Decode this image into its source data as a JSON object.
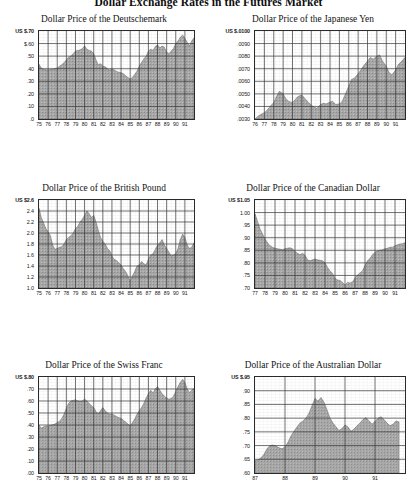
{
  "page": {
    "title": "Dollar Exchange Rates in the Futures Market",
    "background_color": "#ffffff",
    "fill_color": "#a8a8a8",
    "grid_color": "#333333",
    "axis_color": "#2a2a2a"
  },
  "chart_data": [
    {
      "id": "deutschemark",
      "type": "area",
      "title": "Dollar Price of the Deutschemark",
      "xlabel": "",
      "ylabel": "",
      "ylim": [
        0.0,
        0.7
      ],
      "ytick_labels": [
        "US $.70",
        "$.60",
        ".50",
        ".40",
        ".30",
        ".20",
        ".10",
        ".0"
      ],
      "ytick_values": [
        0.7,
        0.6,
        0.5,
        0.4,
        0.3,
        0.2,
        0.1,
        0.0
      ],
      "xtick_labels": [
        "75",
        "76",
        "77",
        "78",
        "79",
        "80",
        "81",
        "82",
        "83",
        "84",
        "85",
        "86",
        "87",
        "88",
        "89",
        "90",
        "91"
      ],
      "xlim": [
        1975,
        1992
      ],
      "grid": true,
      "x": [
        1975.0,
        1975.25,
        1975.5,
        1975.75,
        1976.0,
        1976.25,
        1976.5,
        1976.75,
        1977.0,
        1977.25,
        1977.5,
        1977.75,
        1978.0,
        1978.25,
        1978.5,
        1978.75,
        1979.0,
        1979.25,
        1979.5,
        1979.75,
        1980.0,
        1980.25,
        1980.5,
        1980.75,
        1981.0,
        1981.25,
        1981.5,
        1981.75,
        1982.0,
        1982.25,
        1982.5,
        1982.75,
        1983.0,
        1983.25,
        1983.5,
        1983.75,
        1984.0,
        1984.25,
        1984.5,
        1984.75,
        1985.0,
        1985.25,
        1985.5,
        1985.75,
        1986.0,
        1986.25,
        1986.5,
        1986.75,
        1987.0,
        1987.25,
        1987.5,
        1987.75,
        1988.0,
        1988.25,
        1988.5,
        1988.75,
        1989.0,
        1989.25,
        1989.5,
        1989.75,
        1990.0,
        1990.25,
        1990.5,
        1990.75,
        1991.0,
        1991.25,
        1991.5,
        1991.75,
        1992.0
      ],
      "values": [
        0.435,
        0.405,
        0.395,
        0.392,
        0.39,
        0.393,
        0.397,
        0.4,
        0.405,
        0.42,
        0.432,
        0.448,
        0.47,
        0.492,
        0.5,
        0.52,
        0.54,
        0.545,
        0.548,
        0.56,
        0.58,
        0.555,
        0.545,
        0.54,
        0.52,
        0.47,
        0.43,
        0.44,
        0.42,
        0.415,
        0.4,
        0.39,
        0.398,
        0.39,
        0.378,
        0.372,
        0.368,
        0.36,
        0.345,
        0.33,
        0.318,
        0.33,
        0.355,
        0.38,
        0.42,
        0.45,
        0.478,
        0.5,
        0.54,
        0.555,
        0.545,
        0.575,
        0.59,
        0.565,
        0.58,
        0.57,
        0.53,
        0.52,
        0.54,
        0.56,
        0.6,
        0.62,
        0.65,
        0.668,
        0.64,
        0.61,
        0.58,
        0.62,
        0.645
      ]
    },
    {
      "id": "japanese-yen",
      "type": "area",
      "title": "Dollar Price of the Japanese Yen",
      "xlabel": "",
      "ylabel": "",
      "ylim": [
        0.003,
        0.01
      ],
      "ytick_labels": [
        "US $.0100",
        ".0090",
        ".0080",
        ".0070",
        ".0060",
        ".0050",
        ".0040",
        ".0030"
      ],
      "ytick_values": [
        0.01,
        0.009,
        0.008,
        0.007,
        0.006,
        0.005,
        0.004,
        0.003
      ],
      "xtick_labels": [
        "76",
        "77",
        "78",
        "79",
        "80",
        "81",
        "82",
        "83",
        "84",
        "85",
        "86",
        "87",
        "88",
        "89",
        "90",
        "91"
      ],
      "xlim": [
        1976,
        1992
      ],
      "grid": true,
      "x": [
        1976.0,
        1976.3,
        1976.6,
        1977.0,
        1977.3,
        1977.6,
        1978.0,
        1978.3,
        1978.6,
        1979.0,
        1979.3,
        1979.6,
        1980.0,
        1980.3,
        1980.6,
        1981.0,
        1981.3,
        1981.6,
        1982.0,
        1982.3,
        1982.6,
        1983.0,
        1983.3,
        1983.6,
        1984.0,
        1984.3,
        1984.6,
        1985.0,
        1985.3,
        1985.6,
        1986.0,
        1986.3,
        1986.6,
        1987.0,
        1987.3,
        1987.6,
        1988.0,
        1988.3,
        1988.6,
        1989.0,
        1989.3,
        1989.6,
        1990.0,
        1990.3,
        1990.6,
        1991.0,
        1991.3,
        1991.6,
        1992.0
      ],
      "values": [
        0.003,
        0.0032,
        0.00335,
        0.0035,
        0.0037,
        0.004,
        0.0043,
        0.0048,
        0.0052,
        0.005,
        0.0046,
        0.0044,
        0.0043,
        0.00455,
        0.0048,
        0.0049,
        0.00465,
        0.0044,
        0.0041,
        0.00395,
        0.00385,
        0.00415,
        0.00425,
        0.0042,
        0.00435,
        0.0044,
        0.00415,
        0.0042,
        0.0044,
        0.0049,
        0.0056,
        0.00615,
        0.00625,
        0.0066,
        0.0069,
        0.00725,
        0.0076,
        0.0079,
        0.00775,
        0.008,
        0.0081,
        0.0076,
        0.0072,
        0.0067,
        0.0065,
        0.0069,
        0.00735,
        0.00755,
        0.0079
      ]
    },
    {
      "id": "british-pound",
      "type": "area",
      "title": "Dollar Price of the British Pound",
      "xlabel": "",
      "ylabel": "",
      "ylim": [
        1.0,
        2.6
      ],
      "ytick_labels": [
        "US $2.6",
        "2.4",
        "2.2",
        "2.0",
        "1.8",
        "1.6",
        "1.4",
        "1.2",
        "1.0"
      ],
      "ytick_values": [
        2.6,
        2.4,
        2.2,
        2.0,
        1.8,
        1.6,
        1.4,
        1.2,
        1.0
      ],
      "xtick_labels": [
        "75",
        "76",
        "77",
        "78",
        "79",
        "80",
        "81",
        "82",
        "83",
        "84",
        "85",
        "86",
        "87",
        "88",
        "89",
        "90",
        "91"
      ],
      "xlim": [
        1975,
        1992
      ],
      "grid": true,
      "x": [
        1975.0,
        1975.25,
        1975.5,
        1975.75,
        1976.0,
        1976.25,
        1976.5,
        1976.75,
        1977.0,
        1977.25,
        1977.5,
        1977.75,
        1978.0,
        1978.25,
        1978.5,
        1978.75,
        1979.0,
        1979.25,
        1979.5,
        1979.75,
        1980.0,
        1980.25,
        1980.5,
        1980.75,
        1981.0,
        1981.25,
        1981.5,
        1981.75,
        1982.0,
        1982.25,
        1982.5,
        1982.75,
        1983.0,
        1983.25,
        1983.5,
        1983.75,
        1984.0,
        1984.25,
        1984.5,
        1984.75,
        1985.0,
        1985.25,
        1985.5,
        1985.75,
        1986.0,
        1986.25,
        1986.5,
        1986.75,
        1987.0,
        1987.25,
        1987.5,
        1987.75,
        1988.0,
        1988.25,
        1988.5,
        1988.75,
        1989.0,
        1989.25,
        1989.5,
        1989.75,
        1990.0,
        1990.25,
        1990.5,
        1990.75,
        1991.0,
        1991.25,
        1991.5,
        1991.75,
        1992.0
      ],
      "values": [
        2.45,
        2.28,
        2.18,
        2.08,
        2.02,
        1.95,
        1.78,
        1.7,
        1.72,
        1.74,
        1.75,
        1.8,
        1.88,
        1.92,
        1.95,
        2.0,
        2.08,
        2.12,
        2.2,
        2.25,
        2.32,
        2.4,
        2.35,
        2.28,
        2.32,
        2.2,
        2.05,
        1.92,
        1.85,
        1.8,
        1.72,
        1.68,
        1.58,
        1.52,
        1.5,
        1.46,
        1.42,
        1.35,
        1.3,
        1.22,
        1.12,
        1.22,
        1.3,
        1.4,
        1.42,
        1.48,
        1.44,
        1.42,
        1.52,
        1.6,
        1.62,
        1.7,
        1.78,
        1.82,
        1.88,
        1.78,
        1.72,
        1.65,
        1.58,
        1.6,
        1.62,
        1.72,
        1.88,
        1.98,
        1.92,
        1.78,
        1.72,
        1.74,
        1.82
      ]
    },
    {
      "id": "canadian-dollar",
      "type": "area",
      "title": "Dollar Price of the Canadian Dollar",
      "xlabel": "",
      "ylabel": "",
      "ylim": [
        0.7,
        1.05
      ],
      "ytick_labels": [
        "US $1.05",
        "1.00",
        ".95",
        ".90",
        ".85",
        ".80",
        ".75",
        ".70"
      ],
      "ytick_values": [
        1.05,
        1.0,
        0.95,
        0.9,
        0.85,
        0.8,
        0.75,
        0.7
      ],
      "xtick_labels": [
        "77",
        "78",
        "79",
        "80",
        "81",
        "82",
        "83",
        "84",
        "85",
        "86",
        "87",
        "88",
        "89",
        "90",
        "91"
      ],
      "xlim": [
        1977,
        1992
      ],
      "grid": true,
      "x": [
        1977.0,
        1977.25,
        1977.5,
        1977.75,
        1978.0,
        1978.25,
        1978.5,
        1978.75,
        1979.0,
        1979.25,
        1979.5,
        1979.75,
        1980.0,
        1980.25,
        1980.5,
        1980.75,
        1981.0,
        1981.25,
        1981.5,
        1981.75,
        1982.0,
        1982.25,
        1982.5,
        1982.75,
        1983.0,
        1983.25,
        1983.5,
        1983.75,
        1984.0,
        1984.25,
        1984.5,
        1984.75,
        1985.0,
        1985.25,
        1985.5,
        1985.75,
        1986.0,
        1986.25,
        1986.5,
        1986.75,
        1987.0,
        1987.25,
        1987.5,
        1987.75,
        1988.0,
        1988.25,
        1988.5,
        1988.75,
        1989.0,
        1989.25,
        1989.5,
        1989.75,
        1990.0,
        1990.25,
        1990.5,
        1990.75,
        1991.0,
        1991.25,
        1991.5,
        1991.75,
        1992.0
      ],
      "values": [
        0.995,
        0.965,
        0.935,
        0.915,
        0.895,
        0.88,
        0.868,
        0.862,
        0.858,
        0.856,
        0.854,
        0.852,
        0.856,
        0.858,
        0.86,
        0.856,
        0.845,
        0.838,
        0.832,
        0.838,
        0.83,
        0.812,
        0.808,
        0.812,
        0.815,
        0.812,
        0.81,
        0.808,
        0.8,
        0.782,
        0.768,
        0.758,
        0.738,
        0.732,
        0.73,
        0.722,
        0.712,
        0.722,
        0.72,
        0.724,
        0.74,
        0.752,
        0.76,
        0.768,
        0.79,
        0.808,
        0.818,
        0.832,
        0.842,
        0.848,
        0.85,
        0.852,
        0.856,
        0.858,
        0.862,
        0.862,
        0.868,
        0.872,
        0.875,
        0.876,
        0.88
      ]
    },
    {
      "id": "swiss-franc",
      "type": "area",
      "title": "Dollar Price of the Swiss Franc",
      "xlabel": "",
      "ylabel": "",
      "ylim": [
        0.0,
        0.8
      ],
      "ytick_labels": [
        "US $.80",
        ".70",
        ".60",
        ".50",
        ".40",
        ".30",
        ".20",
        ".10",
        ".00"
      ],
      "ytick_values": [
        0.8,
        0.7,
        0.6,
        0.5,
        0.4,
        0.3,
        0.2,
        0.1,
        0.0
      ],
      "xtick_labels": [
        "75",
        "76",
        "77",
        "78",
        "79",
        "80",
        "81",
        "82",
        "83",
        "84",
        "85",
        "86",
        "87",
        "88",
        "89",
        "90",
        "91"
      ],
      "xlim": [
        1975,
        1992
      ],
      "grid": true,
      "x": [
        1975.0,
        1975.25,
        1975.5,
        1975.75,
        1976.0,
        1976.25,
        1976.5,
        1976.75,
        1977.0,
        1977.25,
        1977.5,
        1977.75,
        1978.0,
        1978.25,
        1978.5,
        1978.75,
        1979.0,
        1979.25,
        1979.5,
        1979.75,
        1980.0,
        1980.25,
        1980.5,
        1980.75,
        1981.0,
        1981.25,
        1981.5,
        1981.75,
        1982.0,
        1982.25,
        1982.5,
        1982.75,
        1983.0,
        1983.25,
        1983.5,
        1983.75,
        1984.0,
        1984.25,
        1984.5,
        1984.75,
        1985.0,
        1985.25,
        1985.5,
        1985.75,
        1986.0,
        1986.25,
        1986.5,
        1986.75,
        1987.0,
        1987.25,
        1987.5,
        1987.75,
        1988.0,
        1988.25,
        1988.5,
        1988.75,
        1989.0,
        1989.25,
        1989.5,
        1989.75,
        1990.0,
        1990.25,
        1990.5,
        1990.75,
        1991.0,
        1991.25,
        1991.5,
        1991.75,
        1992.0
      ],
      "values": [
        0.4,
        0.372,
        0.385,
        0.392,
        0.39,
        0.398,
        0.402,
        0.408,
        0.42,
        0.43,
        0.455,
        0.49,
        0.54,
        0.58,
        0.6,
        0.605,
        0.61,
        0.6,
        0.595,
        0.6,
        0.615,
        0.6,
        0.58,
        0.56,
        0.545,
        0.512,
        0.49,
        0.52,
        0.545,
        0.52,
        0.5,
        0.49,
        0.492,
        0.482,
        0.47,
        0.462,
        0.455,
        0.44,
        0.425,
        0.408,
        0.39,
        0.42,
        0.45,
        0.49,
        0.52,
        0.545,
        0.58,
        0.625,
        0.66,
        0.69,
        0.665,
        0.7,
        0.72,
        0.69,
        0.66,
        0.64,
        0.625,
        0.615,
        0.62,
        0.64,
        0.68,
        0.72,
        0.755,
        0.78,
        0.755,
        0.7,
        0.67,
        0.69,
        0.705
      ]
    },
    {
      "id": "australian-dollar",
      "type": "area",
      "title": "Dollar Price of the Australian Dollar",
      "xlabel": "",
      "ylabel": "",
      "ylim": [
        0.6,
        0.95
      ],
      "ytick_labels": [
        "US $.95",
        ".90",
        ".85",
        ".80",
        ".75",
        ".70",
        ".65",
        ".60"
      ],
      "ytick_values": [
        0.95,
        0.9,
        0.85,
        0.8,
        0.75,
        0.7,
        0.65,
        0.6
      ],
      "xtick_labels": [
        "87",
        "88",
        "89",
        "90",
        "91"
      ],
      "xlim": [
        1987,
        1992
      ],
      "grid": true,
      "x": [
        1987.0,
        1987.1,
        1987.2,
        1987.3,
        1987.4,
        1987.5,
        1987.6,
        1987.7,
        1987.8,
        1987.9,
        1988.0,
        1988.1,
        1988.2,
        1988.3,
        1988.4,
        1988.5,
        1988.6,
        1988.7,
        1988.8,
        1988.9,
        1989.0,
        1989.1,
        1989.2,
        1989.3,
        1989.4,
        1989.5,
        1989.6,
        1989.7,
        1989.8,
        1989.9,
        1990.0,
        1990.1,
        1990.2,
        1990.3,
        1990.4,
        1990.5,
        1990.6,
        1990.7,
        1990.8,
        1990.9,
        1991.0,
        1991.1,
        1991.2,
        1991.3,
        1991.4,
        1991.5,
        1991.6,
        1991.7,
        1991.8
      ],
      "values": [
        0.645,
        0.648,
        0.655,
        0.668,
        0.688,
        0.7,
        0.702,
        0.698,
        0.692,
        0.688,
        0.695,
        0.712,
        0.735,
        0.752,
        0.768,
        0.782,
        0.79,
        0.8,
        0.818,
        0.845,
        0.872,
        0.862,
        0.875,
        0.858,
        0.83,
        0.8,
        0.782,
        0.768,
        0.755,
        0.762,
        0.775,
        0.768,
        0.752,
        0.76,
        0.772,
        0.782,
        0.795,
        0.802,
        0.79,
        0.778,
        0.788,
        0.8,
        0.805,
        0.795,
        0.782,
        0.772,
        0.778,
        0.79,
        0.786
      ]
    }
  ]
}
